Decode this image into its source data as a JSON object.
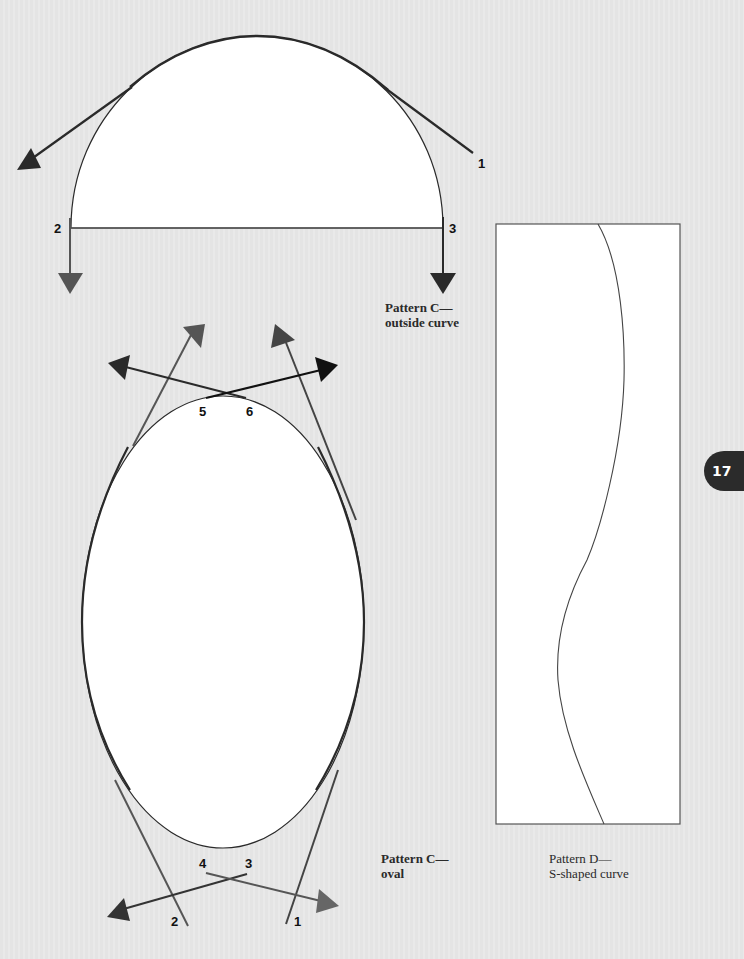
{
  "page": {
    "number": "17",
    "background_color": "#e6e6e6",
    "line_color": "#2a2a2a",
    "tangent_color": "#555555"
  },
  "pattern_c_outside": {
    "caption_line1": "Pattern C—",
    "caption_line2": "outside curve",
    "labels": {
      "p1": "1",
      "p2": "2",
      "p3": "3"
    }
  },
  "pattern_c_oval": {
    "caption_line1": "Pattern C—",
    "caption_line2": "oval",
    "labels": {
      "p1": "1",
      "p2": "2",
      "p3": "3",
      "p4": "4",
      "p5": "5",
      "p6": "6"
    }
  },
  "pattern_d": {
    "caption_line1": "Pattern D—",
    "caption_line2": "S-shaped curve"
  }
}
